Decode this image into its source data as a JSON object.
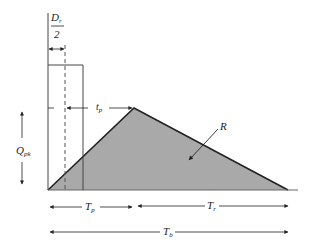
{
  "diagram": {
    "type": "SCS triangular unit hydrograph",
    "colors": {
      "fill": "#a9a9a9",
      "line": "#222222",
      "background": "#ffffff"
    },
    "labels": {
      "duration_num": "D",
      "duration_num_sub": "r",
      "duration_den": "2",
      "lag_time": "t",
      "lag_time_sub": "p",
      "peak_flow": "Q",
      "peak_flow_sub": "pk",
      "runoff_volume": "R",
      "time_to_peak": "T",
      "time_to_peak_sub": "p",
      "recession_time": "T",
      "recession_time_sub": "r",
      "base_time": "T",
      "base_time_sub": "b"
    }
  }
}
